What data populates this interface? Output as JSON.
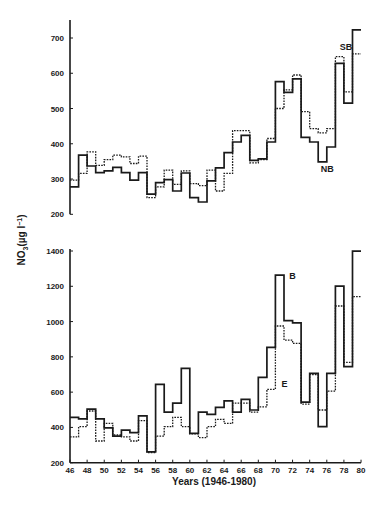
{
  "chart_data": [
    {
      "type": "line",
      "step": true,
      "title": "",
      "xlabel": "",
      "ylabel": "NO3 (µg l⁻¹)",
      "ylim": [
        200,
        700
      ],
      "yticks": [
        200,
        300,
        400,
        500,
        600,
        700
      ],
      "x": [
        46,
        47,
        48,
        49,
        50,
        51,
        52,
        53,
        54,
        55,
        56,
        57,
        58,
        59,
        60,
        61,
        62,
        63,
        64,
        65,
        66,
        67,
        68,
        69,
        70,
        71,
        72,
        73,
        74,
        75,
        76,
        77,
        78,
        79
      ],
      "series": [
        {
          "name": "NB",
          "style": "solid",
          "values": [
            278,
            368,
            337,
            318,
            323,
            333,
            318,
            297,
            318,
            257,
            290,
            298,
            266,
            317,
            247,
            235,
            295,
            332,
            375,
            405,
            424,
            353,
            357,
            405,
            576,
            546,
            584,
            418,
            405,
            349,
            391,
            628,
            515,
            723
          ]
        },
        {
          "name": "SB",
          "style": "dotted",
          "values": [
            297,
            316,
            377,
            339,
            355,
            368,
            363,
            344,
            365,
            247,
            278,
            325,
            285,
            323,
            287,
            281,
            325,
            266,
            316,
            437,
            437,
            346,
            355,
            415,
            500,
            553,
            595,
            491,
            443,
            431,
            443,
            647,
            547,
            655
          ]
        }
      ],
      "annotations": [
        {
          "text": "SB",
          "x": 77.5,
          "y": 665
        },
        {
          "text": "NB",
          "x": 75.3,
          "y": 320
        }
      ],
      "grid": false
    },
    {
      "type": "line",
      "step": true,
      "title": "",
      "xlabel": "Years (1946-1980)",
      "ylabel": "NO3 (µg l⁻¹)",
      "ylim": [
        200,
        1400
      ],
      "yticks": [
        200,
        400,
        600,
        800,
        1000,
        1200,
        1400
      ],
      "xticks": [
        46,
        48,
        50,
        52,
        54,
        56,
        58,
        60,
        62,
        64,
        66,
        68,
        70,
        72,
        74,
        76,
        78,
        80
      ],
      "x": [
        46,
        47,
        48,
        49,
        50,
        51,
        52,
        53,
        54,
        55,
        56,
        57,
        58,
        59,
        60,
        61,
        62,
        63,
        64,
        65,
        66,
        67,
        68,
        69,
        70,
        71,
        72,
        73,
        74,
        75,
        76,
        77,
        78,
        79
      ],
      "series": [
        {
          "name": "B",
          "style": "solid",
          "values": [
            457,
            448,
            504,
            448,
            398,
            351,
            385,
            370,
            465,
            262,
            644,
            486,
            537,
            735,
            366,
            486,
            474,
            514,
            551,
            486,
            559,
            499,
            684,
            854,
            1263,
            1005,
            993,
            543,
            706,
            404,
            706,
            1201,
            744,
            1399
          ]
        },
        {
          "name": "E",
          "style": "dotted",
          "values": [
            347,
            404,
            493,
            323,
            423,
            357,
            347,
            323,
            438,
            257,
            351,
            404,
            457,
            404,
            363,
            342,
            404,
            446,
            423,
            537,
            537,
            486,
            517,
            616,
            975,
            895,
            876,
            532,
            699,
            499,
            606,
            1088,
            769,
            1141
          ]
        }
      ],
      "annotations": [
        {
          "text": "B",
          "x": 71.6,
          "y": 1240
        },
        {
          "text": "E",
          "x": 70.7,
          "y": 630
        }
      ],
      "grid": false
    }
  ],
  "axis": {
    "ylabel_main": "NO",
    "ylabel_sub": "3",
    "ylabel_rest": "(µg l",
    "ylabel_sup": "−1",
    "ylabel_close": ")",
    "xlabel": "Years (1946-1980)"
  }
}
